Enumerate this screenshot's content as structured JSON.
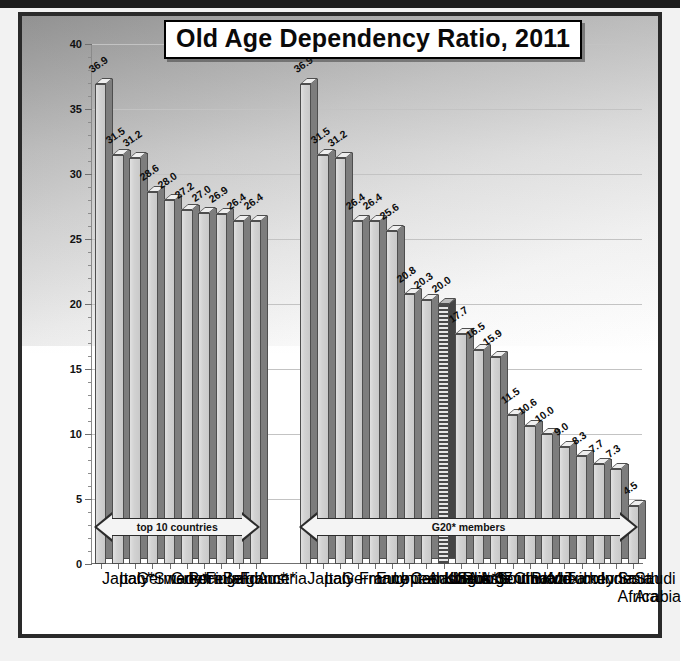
{
  "chart_data": {
    "type": "bar",
    "title": "Old Age Dependency Ratio, 2011",
    "xlabel": "",
    "ylabel": "population above age 64 per 100 ages 15–64",
    "ylim": [
      0,
      40
    ],
    "ytick_values": [
      0,
      5,
      10,
      15,
      20,
      25,
      30,
      35,
      40
    ],
    "ytick_labels": [
      "0",
      "5",
      "10",
      "15",
      "20",
      "25",
      "30",
      "35",
      "40"
    ],
    "grid": true,
    "legend": "none",
    "groups": [
      {
        "name": "top 10 countries",
        "annotation": "top 10 countries",
        "categories": [
          "Japan*",
          "Italy*",
          "Germany*",
          "Sweden",
          "Greece",
          "Portugal",
          "Finland",
          "Belgium*",
          "France*",
          "Austria"
        ],
        "values": [
          36.9,
          31.5,
          31.2,
          28.6,
          28.0,
          27.2,
          27.0,
          26.9,
          26.4,
          26.4
        ],
        "labels": [
          "36.9",
          "31.5",
          "31.2",
          "28.6",
          "28.0",
          "27.2",
          "27.0",
          "26.9",
          "26.4",
          "26.4"
        ],
        "highlight_index": -1
      },
      {
        "name": "G20* members",
        "annotation": "G20* members",
        "categories": [
          "Japan",
          "Italy",
          "Germany",
          "France",
          "European Union**",
          "United Kingdom",
          "Canada",
          "Australia",
          "USA # 37 in world",
          "Russia",
          "Argentina",
          "South Korea",
          "China",
          "Brazil",
          "Mexico",
          "Turkey",
          "Indonesia",
          "India",
          "South Africa",
          "Saudi Arabia"
        ],
        "values": [
          36.9,
          31.5,
          31.2,
          26.4,
          26.4,
          25.6,
          20.8,
          20.3,
          20.0,
          17.7,
          16.5,
          15.9,
          11.5,
          10.6,
          10.0,
          9.0,
          8.3,
          7.7,
          7.3,
          4.5
        ],
        "labels": [
          "36.9",
          "31.5",
          "31.2",
          "26.4",
          "26.4",
          "25.6",
          "20.8",
          "20.3",
          "20.0",
          "17.7",
          "16.5",
          "15.9",
          "11.5",
          "10.6",
          "10.0",
          "9.0",
          "8.3",
          "7.7",
          "7.3",
          "4.5"
        ],
        "highlight_index": 8
      }
    ],
    "colors": {
      "bar_front": "#d2d2d2",
      "bar_side": "#7d7d7d",
      "highlight_bar": "#4a4a4a",
      "gridline": "#c3c3c3",
      "axis": "#6f6f6f",
      "text": "#111111",
      "frame": "#2a2a2a"
    }
  }
}
